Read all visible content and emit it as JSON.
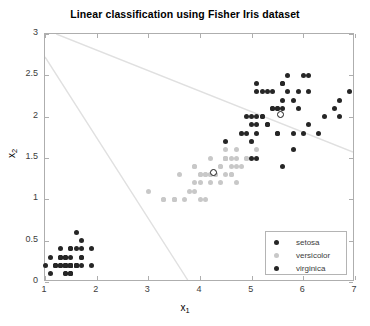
{
  "chart_data": {
    "type": "scatter",
    "title": "Linear classification using Fisher Iris dataset",
    "xlabel": "x_1",
    "ylabel": "x_2",
    "xlabel_base": "x",
    "xlabel_sub": "1",
    "ylabel_base": "x",
    "ylabel_sub": "2",
    "xlim": [
      1,
      7
    ],
    "ylim": [
      0,
      3
    ],
    "xticks": [
      1,
      2,
      3,
      4,
      5,
      6,
      7
    ],
    "yticks": [
      0,
      0.5,
      1,
      1.5,
      2,
      2.5,
      3
    ],
    "xticklabels": [
      "1",
      "2",
      "3",
      "4",
      "5",
      "6",
      "7"
    ],
    "yticklabels": [
      "0",
      "0.5",
      "1",
      "1.5",
      "2",
      "2.5",
      "3"
    ],
    "grid": false,
    "legend_position": "lower right",
    "colors": {
      "setosa": "#262626",
      "versicolor": "#c8c8c8",
      "virginica": "#262626",
      "boundary": "#e0e0e0",
      "axis": "#aeaeae",
      "text": "#3c3c3c"
    },
    "series": [
      {
        "name": "setosa",
        "color": "#262626",
        "marker": "circle",
        "points": [
          [
            1.0,
            0.2
          ],
          [
            1.1,
            0.3
          ],
          [
            1.1,
            0.1
          ],
          [
            1.2,
            0.2
          ],
          [
            1.2,
            0.2
          ],
          [
            1.3,
            0.2
          ],
          [
            1.3,
            0.3
          ],
          [
            1.3,
            0.4
          ],
          [
            1.3,
            0.2
          ],
          [
            1.3,
            0.2
          ],
          [
            1.3,
            0.3
          ],
          [
            1.4,
            0.2
          ],
          [
            1.4,
            0.2
          ],
          [
            1.4,
            0.1
          ],
          [
            1.4,
            0.2
          ],
          [
            1.4,
            0.3
          ],
          [
            1.4,
            0.3
          ],
          [
            1.4,
            0.2
          ],
          [
            1.4,
            0.1
          ],
          [
            1.5,
            0.2
          ],
          [
            1.5,
            0.4
          ],
          [
            1.5,
            0.1
          ],
          [
            1.5,
            0.2
          ],
          [
            1.5,
            0.4
          ],
          [
            1.5,
            0.1
          ],
          [
            1.5,
            0.2
          ],
          [
            1.5,
            0.3
          ],
          [
            1.5,
            0.2
          ],
          [
            1.6,
            0.2
          ],
          [
            1.6,
            0.6
          ],
          [
            1.6,
            0.4
          ],
          [
            1.6,
            0.2
          ],
          [
            1.6,
            0.2
          ],
          [
            1.6,
            0.2
          ],
          [
            1.7,
            0.4
          ],
          [
            1.7,
            0.2
          ],
          [
            1.7,
            0.3
          ],
          [
            1.7,
            0.5
          ],
          [
            1.7,
            0.3
          ],
          [
            1.9,
            0.4
          ],
          [
            1.9,
            0.2
          ],
          [
            1.5,
            0.1
          ],
          [
            1.4,
            0.2
          ],
          [
            1.3,
            0.3
          ],
          [
            1.2,
            0.2
          ],
          [
            1.4,
            0.2
          ],
          [
            1.5,
            0.2
          ],
          [
            1.6,
            0.2
          ],
          [
            1.4,
            0.3
          ],
          [
            1.5,
            0.2
          ]
        ]
      },
      {
        "name": "versicolor",
        "color": "#c8c8c8",
        "marker": "circle",
        "points": [
          [
            3.0,
            1.1
          ],
          [
            3.3,
            1.0
          ],
          [
            3.3,
            1.0
          ],
          [
            3.5,
            1.0
          ],
          [
            3.5,
            1.0
          ],
          [
            3.6,
            1.3
          ],
          [
            3.7,
            1.0
          ],
          [
            3.8,
            1.1
          ],
          [
            3.9,
            1.2
          ],
          [
            3.9,
            1.4
          ],
          [
            3.9,
            1.1
          ],
          [
            4.0,
            1.0
          ],
          [
            4.0,
            1.3
          ],
          [
            4.0,
            1.3
          ],
          [
            4.0,
            1.2
          ],
          [
            4.1,
            1.0
          ],
          [
            4.1,
            1.3
          ],
          [
            4.1,
            1.3
          ],
          [
            4.2,
            1.3
          ],
          [
            4.2,
            1.2
          ],
          [
            4.2,
            1.3
          ],
          [
            4.2,
            1.5
          ],
          [
            4.3,
            1.3
          ],
          [
            4.3,
            1.3
          ],
          [
            4.4,
            1.4
          ],
          [
            4.4,
            1.2
          ],
          [
            4.4,
            1.4
          ],
          [
            4.5,
            1.5
          ],
          [
            4.5,
            1.5
          ],
          [
            4.5,
            1.3
          ],
          [
            4.5,
            1.6
          ],
          [
            4.5,
            1.5
          ],
          [
            4.5,
            1.5
          ],
          [
            4.6,
            1.3
          ],
          [
            4.6,
            1.4
          ],
          [
            4.6,
            1.5
          ],
          [
            4.6,
            1.3
          ],
          [
            4.7,
            1.4
          ],
          [
            4.7,
            1.6
          ],
          [
            4.7,
            1.5
          ],
          [
            4.7,
            1.2
          ],
          [
            4.8,
            1.8
          ],
          [
            4.8,
            1.4
          ],
          [
            4.8,
            1.8
          ],
          [
            4.9,
            1.5
          ],
          [
            4.9,
            1.5
          ],
          [
            5.0,
            1.7
          ],
          [
            5.1,
            1.6
          ],
          [
            3.5,
            1.0
          ],
          [
            3.9,
            1.4
          ]
        ]
      },
      {
        "name": "virginica",
        "color": "#262626",
        "marker": "circle",
        "points": [
          [
            4.5,
            1.7
          ],
          [
            4.9,
            1.8
          ],
          [
            4.9,
            2.0
          ],
          [
            5.0,
            1.5
          ],
          [
            5.0,
            1.7
          ],
          [
            5.0,
            1.9
          ],
          [
            5.0,
            2.0
          ],
          [
            5.1,
            1.5
          ],
          [
            5.1,
            1.9
          ],
          [
            5.1,
            2.0
          ],
          [
            5.1,
            2.3
          ],
          [
            5.1,
            1.8
          ],
          [
            5.2,
            2.0
          ],
          [
            5.2,
            2.3
          ],
          [
            5.3,
            1.9
          ],
          [
            5.3,
            2.3
          ],
          [
            5.4,
            2.1
          ],
          [
            5.4,
            2.3
          ],
          [
            5.5,
            1.8
          ],
          [
            5.5,
            2.1
          ],
          [
            5.5,
            1.8
          ],
          [
            5.6,
            2.1
          ],
          [
            5.6,
            2.4
          ],
          [
            5.6,
            1.4
          ],
          [
            5.6,
            2.2
          ],
          [
            5.6,
            2.4
          ],
          [
            5.7,
            2.3
          ],
          [
            5.7,
            2.5
          ],
          [
            5.8,
            1.6
          ],
          [
            5.8,
            1.8
          ],
          [
            5.8,
            2.2
          ],
          [
            5.9,
            2.1
          ],
          [
            5.9,
            2.3
          ],
          [
            6.0,
            1.8
          ],
          [
            6.0,
            2.5
          ],
          [
            6.1,
            1.9
          ],
          [
            6.1,
            2.3
          ],
          [
            6.1,
            2.5
          ],
          [
            6.3,
            1.8
          ],
          [
            6.4,
            2.0
          ],
          [
            6.6,
            2.1
          ],
          [
            6.7,
            2.0
          ],
          [
            6.7,
            2.2
          ],
          [
            6.9,
            2.3
          ],
          [
            5.1,
            2.4
          ],
          [
            5.2,
            2.0
          ],
          [
            5.3,
            1.9
          ],
          [
            5.4,
            2.1
          ],
          [
            5.5,
            2.1
          ],
          [
            4.8,
            1.8
          ]
        ]
      }
    ],
    "centroids": [
      {
        "name": "versicolor-centroid",
        "x": 4.26,
        "y": 1.33
      },
      {
        "name": "virginica-centroid",
        "x": 5.55,
        "y": 2.03
      }
    ],
    "boundaries": [
      {
        "name": "boundary-1",
        "x1": 1.22,
        "y1": 3.0,
        "x2": 7.0,
        "y2": 1.56
      },
      {
        "name": "boundary-2",
        "x1": 1.0,
        "y1": 2.72,
        "x2": 3.78,
        "y2": 0.0
      }
    ],
    "legend": [
      {
        "label": "setosa",
        "color": "#262626"
      },
      {
        "label": "versicolor",
        "color": "#c8c8c8"
      },
      {
        "label": "virginica",
        "color": "#262626"
      }
    ]
  }
}
